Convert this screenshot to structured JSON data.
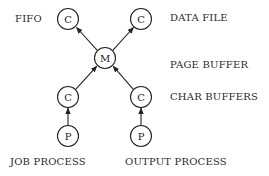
{
  "diagram": {
    "nodes": [
      {
        "id": "c_fifo",
        "label": "C",
        "x": 68,
        "y": 19
      },
      {
        "id": "c_datafile",
        "label": "C",
        "x": 141,
        "y": 19
      },
      {
        "id": "m",
        "label": "M",
        "x": 105,
        "y": 58
      },
      {
        "id": "c_left",
        "label": "C",
        "x": 68,
        "y": 97
      },
      {
        "id": "c_right",
        "label": "C",
        "x": 141,
        "y": 97
      },
      {
        "id": "p_left",
        "label": "P",
        "x": 68,
        "y": 136
      },
      {
        "id": "p_right",
        "label": "P",
        "x": 141,
        "y": 136
      }
    ],
    "edges": [
      {
        "from": "m",
        "to": "c_fifo"
      },
      {
        "from": "m",
        "to": "c_datafile"
      },
      {
        "from": "c_left",
        "to": "m"
      },
      {
        "from": "c_right",
        "to": "m"
      },
      {
        "from": "p_left",
        "to": "c_left"
      },
      {
        "from": "p_right",
        "to": "c_right"
      }
    ],
    "labels": {
      "fifo": "FIFO",
      "data_file": "DATA FILE",
      "page_buffer": "PAGE BUFFER",
      "char_buffers": "CHAR BUFFERS",
      "job_process": "JOB PROCESS",
      "output_process": "OUTPUT PROCESS"
    },
    "colors": {
      "stroke": "#222222",
      "background": "#ffffff"
    }
  }
}
